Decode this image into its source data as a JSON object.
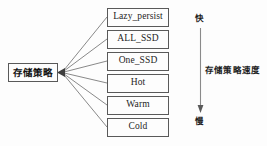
{
  "diagram": {
    "title": "存储策略",
    "root_node": {
      "label": "存储策略",
      "name": "storage-policy-root-node"
    },
    "policies": [
      {
        "label": "Lazy_persist"
      },
      {
        "label": "ALL_SSD"
      },
      {
        "label": "One_SSD"
      },
      {
        "label": "Hot"
      },
      {
        "label": "Warm"
      },
      {
        "label": "Cold"
      }
    ],
    "speed_axis": {
      "top_label": "快",
      "bottom_label": "慢",
      "axis_label": "存储策略速度",
      "direction": "down"
    },
    "colors": {
      "background": "#fdfdfd",
      "border": "#595959",
      "text": "#1d1d1d",
      "edge": "#6b6b6b",
      "axis": "#787878"
    }
  }
}
